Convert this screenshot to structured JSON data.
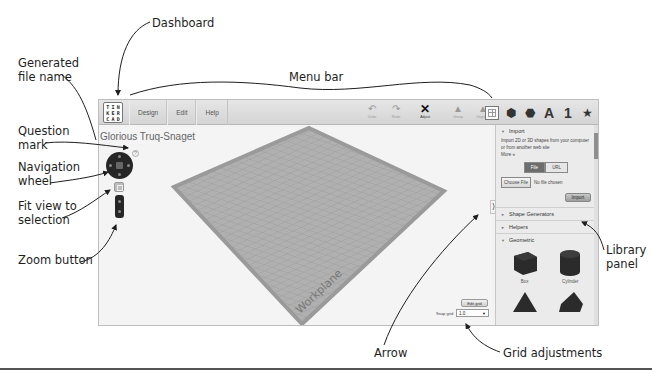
{
  "annotations": {
    "dashboard": "Dashboard",
    "generated_file_name": [
      "Generated",
      "file name"
    ],
    "menu_bar": "Menu bar",
    "question_mark": [
      "Question",
      "mark"
    ],
    "navigation_wheel": [
      "Navigation",
      "wheel"
    ],
    "fit_view": [
      "Fit view to",
      "selection"
    ],
    "zoom_button": "Zoom button",
    "library_panel": [
      "Library",
      "panel"
    ],
    "arrow": "Arrow",
    "grid_adjustments": "Grid adjustments"
  },
  "app": {
    "logo": [
      "T",
      "I",
      "N",
      "K",
      "E",
      "R",
      "C",
      "A",
      "D"
    ],
    "menu": [
      "Design",
      "Edit",
      "Help"
    ],
    "tools": [
      {
        "icon": "undo-icon",
        "glyph": "↶",
        "label": "Undo"
      },
      {
        "icon": "redo-icon",
        "glyph": "↷",
        "label": "Redo"
      },
      {
        "icon": "adjust-icon",
        "glyph": "✕",
        "label": "Adjust"
      },
      {
        "icon": "group-icon",
        "glyph": "▲",
        "label": "Group"
      },
      {
        "icon": "ungroup-icon",
        "glyph": "▲",
        "label": "Ungroup"
      }
    ],
    "library_icons": [
      {
        "name": "grid-view-icon",
        "glyph": ""
      },
      {
        "name": "cube-icon",
        "glyph": "⬢"
      },
      {
        "name": "sphere-icon",
        "glyph": "⬣"
      },
      {
        "name": "letter-icon",
        "glyph": "A"
      },
      {
        "name": "number-icon",
        "glyph": "1"
      },
      {
        "name": "star-icon",
        "glyph": "★"
      }
    ],
    "file_name": "Glorious Truq-Snaget",
    "help_glyph": "?",
    "workplane_label": "Workplane",
    "edit_grid": "Edit grid",
    "snap_grid_label": "Snap grid",
    "snap_grid_value": "1.0",
    "collapse_glyph": "⟩",
    "library": {
      "import": {
        "title": "Import",
        "desc": "Import 2D or 3D shapes from your computer or from another web site",
        "more": "More »",
        "tab_file": "File",
        "tab_url": "URL",
        "choose_file": "Choose File",
        "no_file": "No file chosen",
        "import_btn": "Import"
      },
      "sections": [
        "Shape Generators",
        "Helpers"
      ],
      "geometric": {
        "title": "Geometric",
        "shapes": [
          "Box",
          "Cylinder",
          "",
          ""
        ]
      }
    }
  },
  "colors": {
    "toolbar": "#d9d9d9",
    "workplane": "#a9a9a9",
    "workplane_border": "#9a9a9a",
    "shape": "#2b2b2b"
  }
}
